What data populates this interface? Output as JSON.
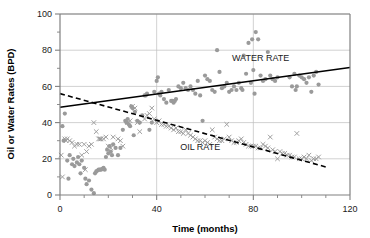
{
  "chart_data": {
    "type": "scatter",
    "title": "",
    "xlabel": "Time (months)",
    "ylabel": "Oil or Water Rates (BPD)",
    "xlim": [
      0,
      120
    ],
    "ylim": [
      0,
      100
    ],
    "xticks": [
      0,
      40,
      80,
      120
    ],
    "yticks": [
      0,
      20,
      40,
      60,
      80,
      100
    ],
    "x_minor_step": 10,
    "y_minor_step": 10,
    "grid": "horizontal-and-vertical-major",
    "legend": "inline-annotations",
    "annotations": [
      {
        "text": "WATER RATE",
        "x": 83,
        "y": 74,
        "name": "water-rate-label"
      },
      {
        "text": "OIL RATE",
        "x": 58,
        "y": 25,
        "name": "oil-rate-label"
      }
    ],
    "marker_colors": {
      "water": "#9a9a9a",
      "oil": "#9a9a9a"
    },
    "trend_color": "#000000",
    "series": [
      {
        "name": "WATER RATE",
        "marker": "filled-circle",
        "color": "#9a9a9a",
        "trend": {
          "style": "solid",
          "x0": 0,
          "y0": 48.5,
          "x1": 120,
          "y1": 70.5
        },
        "points": [
          [
            1,
            38
          ],
          [
            1.5,
            30
          ],
          [
            2,
            45
          ],
          [
            3,
            19
          ],
          [
            3.5,
            9
          ],
          [
            4,
            22
          ],
          [
            5,
            17
          ],
          [
            5.5,
            20
          ],
          [
            6,
            16
          ],
          [
            7,
            18
          ],
          [
            7.5,
            21
          ],
          [
            8,
            17
          ],
          [
            8.5,
            12
          ],
          [
            9,
            19
          ],
          [
            10,
            15
          ],
          [
            10.5,
            9
          ],
          [
            11,
            6
          ],
          [
            12,
            8
          ],
          [
            13,
            3
          ],
          [
            14,
            1
          ],
          [
            14.5,
            12
          ],
          [
            15,
            13
          ],
          [
            15.5,
            13.5
          ],
          [
            16,
            14
          ],
          [
            16.5,
            14
          ],
          [
            17,
            14
          ],
          [
            17.5,
            14.5
          ],
          [
            18,
            15
          ],
          [
            18.5,
            14
          ],
          [
            19,
            21
          ],
          [
            19.5,
            25
          ],
          [
            20,
            23
          ],
          [
            20.5,
            27
          ],
          [
            21,
            24
          ],
          [
            21.5,
            22
          ],
          [
            22,
            28
          ],
          [
            23,
            26
          ],
          [
            24,
            22
          ],
          [
            25,
            26
          ],
          [
            26,
            36
          ],
          [
            27,
            41
          ],
          [
            27.5,
            40
          ],
          [
            28,
            42
          ],
          [
            28.5,
            39
          ],
          [
            29,
            38
          ],
          [
            29.5,
            49
          ],
          [
            30,
            48
          ],
          [
            30.5,
            33
          ],
          [
            31,
            46
          ],
          [
            32,
            41
          ],
          [
            33,
            40
          ],
          [
            34,
            44
          ],
          [
            35,
            55
          ],
          [
            35.5,
            55
          ],
          [
            36,
            56
          ],
          [
            37,
            36
          ],
          [
            38,
            40
          ],
          [
            39,
            57
          ],
          [
            40,
            63
          ],
          [
            40.5,
            65
          ],
          [
            41,
            56
          ],
          [
            41.5,
            55
          ],
          [
            42,
            57
          ],
          [
            43,
            53
          ],
          [
            44,
            51
          ],
          [
            45,
            58
          ],
          [
            46,
            52
          ],
          [
            46.5,
            52
          ],
          [
            47,
            51
          ],
          [
            47.5,
            52
          ],
          [
            48,
            53
          ],
          [
            49,
            60
          ],
          [
            50,
            59
          ],
          [
            51,
            62
          ],
          [
            52,
            59
          ],
          [
            53,
            58
          ],
          [
            54,
            60
          ],
          [
            55,
            58
          ],
          [
            56,
            56
          ],
          [
            57,
            63
          ],
          [
            58,
            55
          ],
          [
            59,
            41
          ],
          [
            60,
            66
          ],
          [
            61,
            64
          ],
          [
            62,
            63
          ],
          [
            63,
            58
          ],
          [
            64,
            57
          ],
          [
            65,
            80
          ],
          [
            66,
            68
          ],
          [
            67,
            59
          ],
          [
            68,
            60
          ],
          [
            69,
            62
          ],
          [
            70,
            57
          ],
          [
            71,
            58
          ],
          [
            72,
            60
          ],
          [
            73,
            58
          ],
          [
            74,
            62
          ],
          [
            75,
            59
          ],
          [
            75.5,
            58
          ],
          [
            76,
            77
          ],
          [
            77,
            67
          ],
          [
            78,
            84
          ],
          [
            79,
            62
          ],
          [
            79.5,
            86
          ],
          [
            80,
            69
          ],
          [
            80.5,
            56
          ],
          [
            81,
            90
          ],
          [
            82,
            86
          ],
          [
            83,
            66
          ],
          [
            84,
            63
          ],
          [
            85,
            64
          ],
          [
            86,
            79
          ],
          [
            87,
            66
          ],
          [
            88,
            64
          ],
          [
            89,
            63
          ],
          [
            90,
            65
          ],
          [
            95,
            65
          ],
          [
            96,
            60
          ],
          [
            97,
            67
          ],
          [
            97.5,
            58
          ],
          [
            98,
            60
          ],
          [
            99,
            66
          ],
          [
            100,
            65
          ],
          [
            101,
            64
          ],
          [
            102,
            62
          ],
          [
            103,
            65
          ],
          [
            104,
            57
          ],
          [
            105,
            66
          ],
          [
            106,
            68
          ],
          [
            107,
            61
          ]
        ]
      },
      {
        "name": "OIL RATE",
        "marker": "cross",
        "color": "#9a9a9a",
        "trend": {
          "style": "dashed",
          "x0": 0,
          "y0": 56,
          "x1": 110,
          "y1": 15.5
        },
        "points": [
          [
            0.5,
            22
          ],
          [
            1,
            10
          ],
          [
            2,
            31
          ],
          [
            2.5,
            30
          ],
          [
            3,
            31
          ],
          [
            4,
            30
          ],
          [
            5,
            29
          ],
          [
            6,
            27
          ],
          [
            7,
            28
          ],
          [
            8,
            28
          ],
          [
            9,
            22
          ],
          [
            10,
            28
          ],
          [
            10.5,
            14
          ],
          [
            11,
            24
          ],
          [
            12,
            27
          ],
          [
            13,
            28
          ],
          [
            14,
            40
          ],
          [
            15,
            35
          ],
          [
            16,
            31
          ],
          [
            16.5,
            31
          ],
          [
            17,
            31
          ],
          [
            18,
            31
          ],
          [
            19,
            32
          ],
          [
            20,
            27
          ],
          [
            21,
            26
          ],
          [
            22,
            32
          ],
          [
            24,
            31
          ],
          [
            25,
            30
          ],
          [
            26,
            27
          ],
          [
            28,
            40
          ],
          [
            29,
            41
          ],
          [
            30,
            49
          ],
          [
            31,
            48
          ],
          [
            32,
            40
          ],
          [
            33,
            35
          ],
          [
            35,
            42
          ],
          [
            36,
            44
          ],
          [
            37,
            45
          ],
          [
            38,
            48
          ],
          [
            39,
            42
          ],
          [
            40,
            40
          ],
          [
            41,
            41
          ],
          [
            42,
            39
          ],
          [
            43,
            39
          ],
          [
            44,
            38
          ],
          [
            45,
            38
          ],
          [
            46,
            37
          ],
          [
            47,
            36
          ],
          [
            48,
            37
          ],
          [
            49,
            35
          ],
          [
            50,
            35
          ],
          [
            51,
            34
          ],
          [
            52,
            36
          ],
          [
            53,
            34
          ],
          [
            54,
            33
          ],
          [
            55,
            32
          ],
          [
            56,
            31
          ],
          [
            57,
            30
          ],
          [
            58,
            30
          ],
          [
            59,
            29
          ],
          [
            60,
            30
          ],
          [
            61,
            29
          ],
          [
            62,
            28
          ],
          [
            63,
            36
          ],
          [
            64,
            32
          ],
          [
            65,
            31
          ],
          [
            66,
            30
          ],
          [
            67,
            30
          ],
          [
            68,
            31
          ],
          [
            69,
            39
          ],
          [
            70,
            32
          ],
          [
            71,
            30
          ],
          [
            72,
            29
          ],
          [
            73,
            29
          ],
          [
            74,
            30
          ],
          [
            75,
            31
          ],
          [
            76,
            29
          ],
          [
            77,
            28
          ],
          [
            78,
            27
          ],
          [
            79,
            27
          ],
          [
            80,
            27
          ],
          [
            81,
            27
          ],
          [
            82,
            26
          ],
          [
            83,
            26
          ],
          [
            84,
            28
          ],
          [
            85,
            27
          ],
          [
            86,
            26
          ],
          [
            87,
            32
          ],
          [
            88,
            25
          ],
          [
            89,
            24
          ],
          [
            90,
            20
          ],
          [
            91,
            24
          ],
          [
            92,
            23
          ],
          [
            93,
            23
          ],
          [
            94,
            22
          ],
          [
            95,
            22
          ],
          [
            96,
            21
          ],
          [
            97,
            21
          ],
          [
            98,
            34
          ],
          [
            99,
            20
          ],
          [
            100,
            20
          ],
          [
            101,
            21
          ],
          [
            102,
            20
          ],
          [
            103,
            22
          ],
          [
            104,
            19
          ],
          [
            105,
            20
          ],
          [
            106,
            20
          ],
          [
            107,
            21
          ]
        ]
      }
    ]
  }
}
